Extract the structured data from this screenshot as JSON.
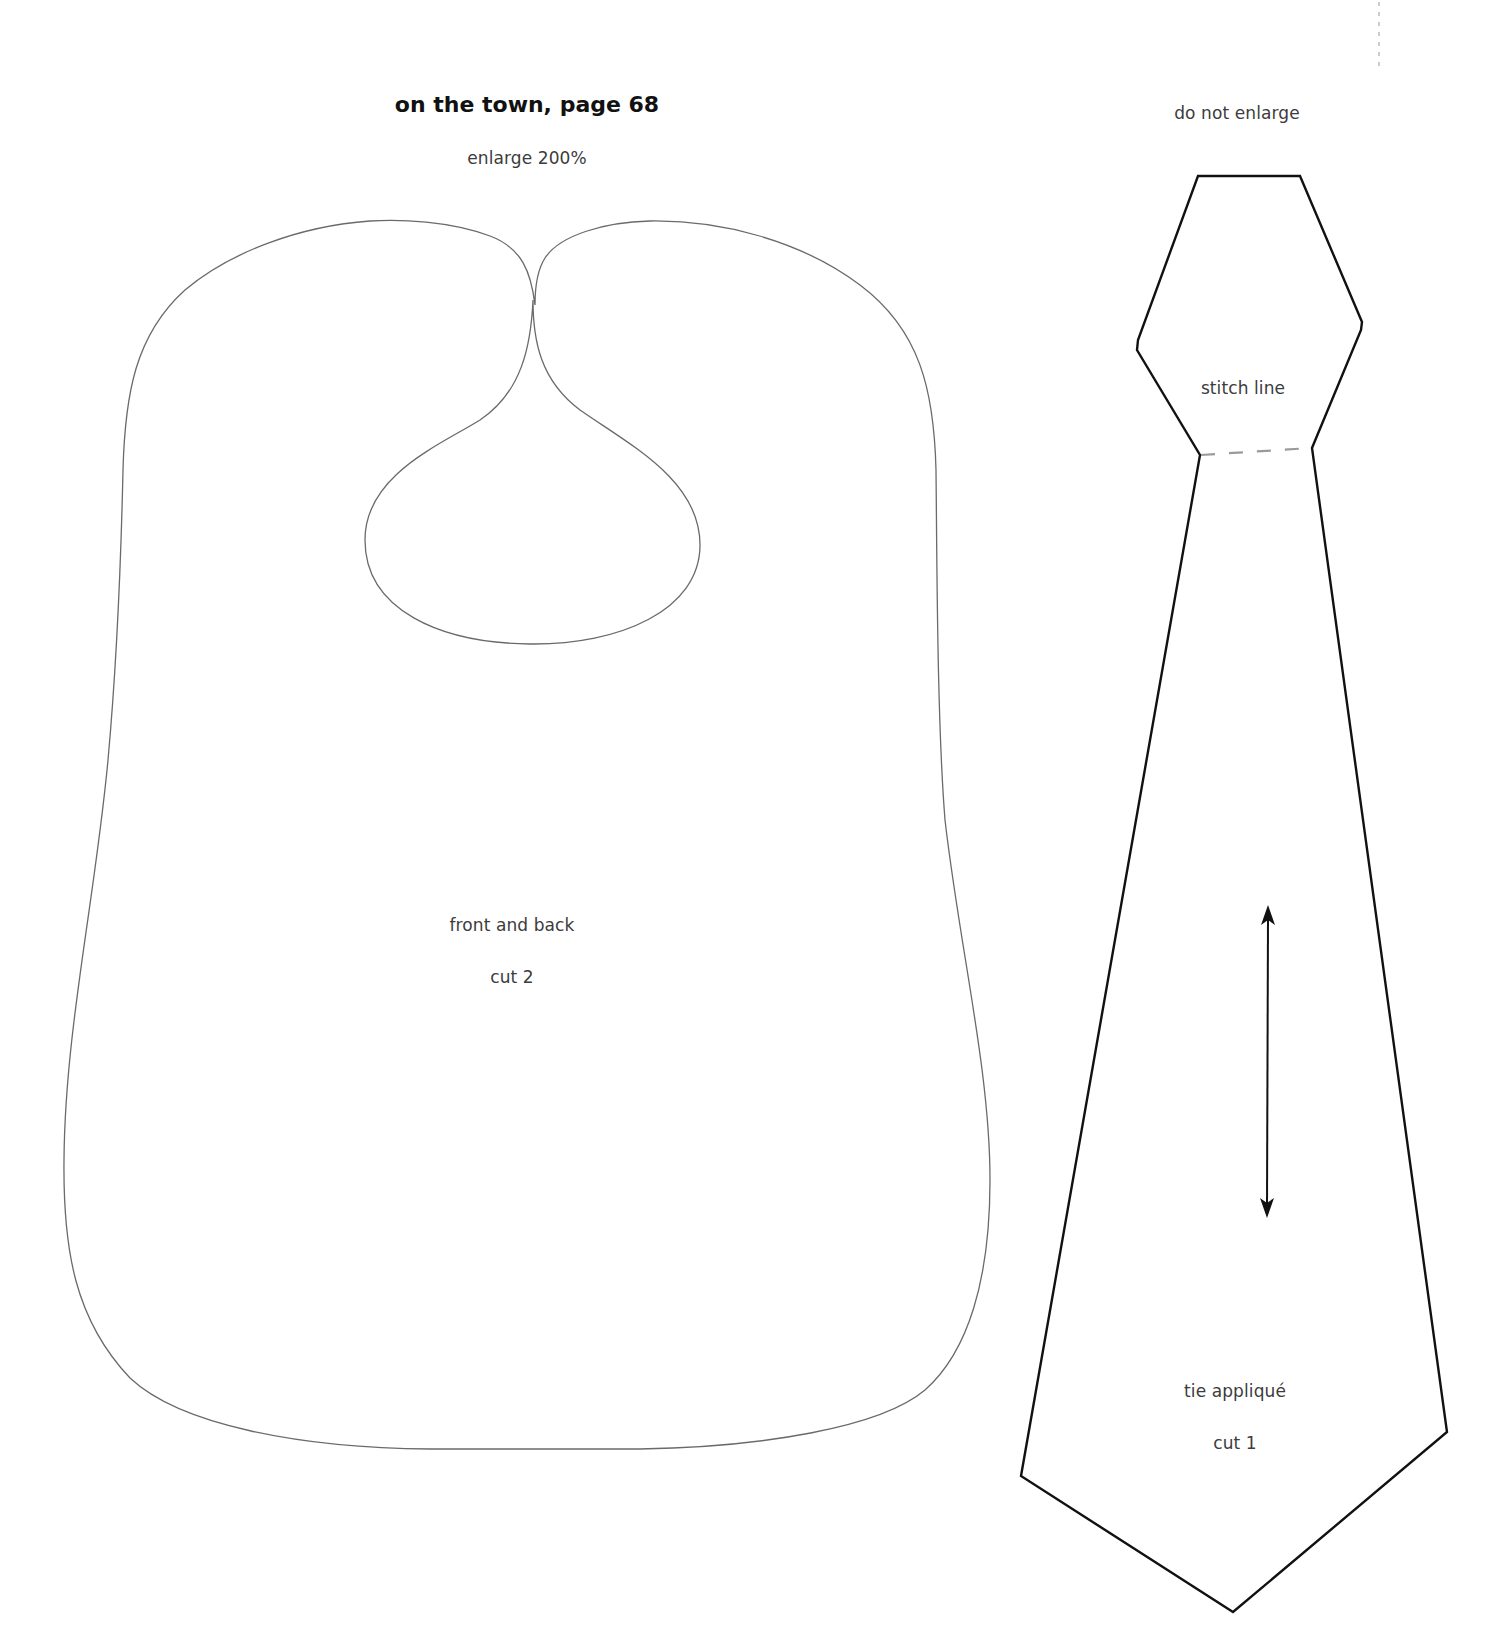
{
  "page": {
    "title": "on the town, page 68",
    "colors": {
      "background": "#ffffff",
      "bib_outline": "#6a6a6a",
      "tie_outline": "#111111",
      "stitch_line": "#9a9a9a"
    }
  },
  "bib_pattern": {
    "scale_note": "enlarge 200%",
    "piece_name": "front and back",
    "cut_count": "cut 2"
  },
  "tie_pattern": {
    "scale_note": "do not enlarge",
    "stitch_label": "stitch line",
    "piece_name": "tie appliqué",
    "cut_count": "cut 1",
    "grainline": "double-headed-arrow"
  }
}
